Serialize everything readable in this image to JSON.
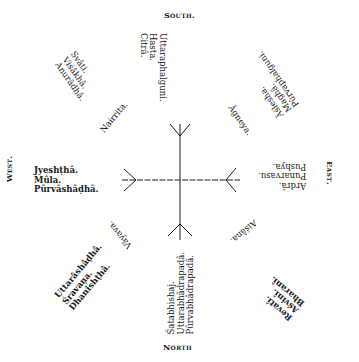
{
  "diagram": {
    "cardinal": {
      "south": "South.",
      "north": "North",
      "east": "East.",
      "west": "West."
    },
    "intermediate": {
      "southwest": "Nairrita.",
      "southeast": "Âgneya.",
      "northeast": "Aiśâna.",
      "northwest": "Vâyava."
    },
    "nakshatra_groups": {
      "south": [
        "Uttaraphalguni.",
        "Hasta.",
        "Citrâ."
      ],
      "south_west": [
        "Svâti.",
        "Viśâkhâ.",
        "Anurâdhâ."
      ],
      "south_east": [
        "Âślesha.",
        "Maghâ.",
        "Pûrvaphalguni."
      ],
      "east": [
        "Ardrâ.",
        "Punarvasu.",
        "Pushya."
      ],
      "west": [
        "Jyeshṭhâ.",
        "Mûla.",
        "Pûrvâshâḍhâ."
      ],
      "north_west": [
        "Uttarâshâḍhâ.",
        "Śravaṇa.",
        "Dhanishṭhâ."
      ],
      "north": [
        "Śatabhishaj.",
        "Uttarabhâdrapadâ.",
        "Pûrvabhâdrapadâ."
      ],
      "north_east": [
        "Revatî.",
        "Aśvinî.",
        "Bharanî."
      ]
    },
    "colors": {
      "ink": "#1a1a1a",
      "paper": "#ffffff"
    }
  }
}
